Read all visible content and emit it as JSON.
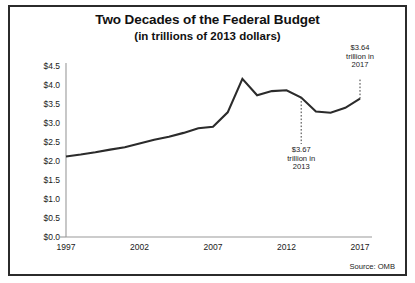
{
  "chart_data": {
    "type": "line",
    "title": "Two Decades of the Federal Budget",
    "subtitle": "(in trillions of 2013 dollars)",
    "xlabel": "",
    "ylabel": "",
    "xlim": [
      1997,
      2017
    ],
    "ylim": [
      0.0,
      4.5
    ],
    "grid": false,
    "legend": "none",
    "line_color": "#2b2b2b",
    "x_ticks": [
      "1997",
      "2002",
      "2007",
      "2012",
      "2017"
    ],
    "x_tick_values": [
      1997,
      2002,
      2007,
      2012,
      2017
    ],
    "y_ticks": [
      "$0.0",
      "$0.5",
      "$1.0",
      "$1.5",
      "$2.0",
      "$2.5",
      "$3.0",
      "$3.5",
      "$4.0",
      "$4.5"
    ],
    "y_tick_values": [
      0.0,
      0.5,
      1.0,
      1.5,
      2.0,
      2.5,
      3.0,
      3.5,
      4.0,
      4.5
    ],
    "x": [
      1997,
      1998,
      1999,
      2000,
      2001,
      2002,
      2003,
      2004,
      2005,
      2006,
      2007,
      2008,
      2009,
      2010,
      2011,
      2012,
      2013,
      2014,
      2015,
      2016,
      2017
    ],
    "values": [
      2.12,
      2.17,
      2.23,
      2.3,
      2.36,
      2.46,
      2.56,
      2.64,
      2.74,
      2.86,
      2.9,
      3.28,
      4.16,
      3.73,
      3.84,
      3.86,
      3.67,
      3.3,
      3.27,
      3.4,
      3.64
    ],
    "series": [
      {
        "name": "Federal Budget (trillions of 2013 dollars)",
        "values": [
          2.12,
          2.17,
          2.23,
          2.3,
          2.36,
          2.46,
          2.56,
          2.64,
          2.74,
          2.86,
          2.9,
          3.28,
          4.16,
          3.73,
          3.84,
          3.86,
          3.67,
          3.3,
          3.27,
          3.4,
          3.64
        ]
      }
    ],
    "annotations": [
      {
        "id": "annotation-2017",
        "text_line1": "$3.64",
        "text_line2": "trillion in",
        "text_line3": "2017",
        "value": 3.64,
        "year": 2017,
        "leader": "dotted"
      },
      {
        "id": "annotation-2013",
        "text_line1": "$3.67",
        "text_line2": "trillion in",
        "text_line3": "2013",
        "value": 3.67,
        "year": 2013,
        "leader": "dotted"
      }
    ],
    "source": "Source: OMB"
  }
}
